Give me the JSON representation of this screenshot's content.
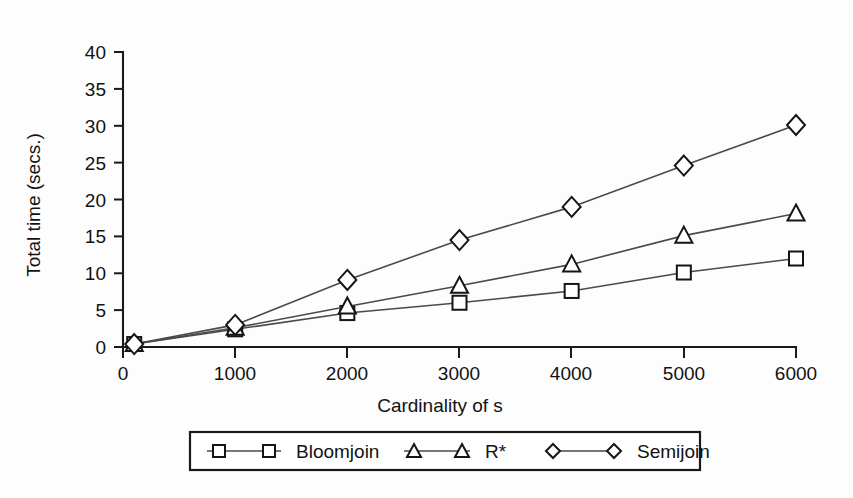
{
  "chart_data": {
    "type": "line",
    "title": "",
    "xlabel": "Cardinality of s",
    "ylabel": "Total time (secs.)",
    "xlim": [
      0,
      6000
    ],
    "ylim": [
      0,
      40
    ],
    "grid": false,
    "legend_position": "bottom",
    "x": [
      100,
      1000,
      2000,
      3000,
      4000,
      5000,
      6000
    ],
    "xticks": [
      "0",
      "1000",
      "2000",
      "3000",
      "4000",
      "5000",
      "6000"
    ],
    "xtick_values": [
      0,
      1000,
      2000,
      3000,
      4000,
      5000,
      6000
    ],
    "yticks": [
      "0",
      "5",
      "10",
      "15",
      "20",
      "25",
      "30",
      "35",
      "40"
    ],
    "ytick_values": [
      0,
      5,
      10,
      15,
      20,
      25,
      30,
      35,
      40
    ],
    "series": [
      {
        "name": "Bloomjoin",
        "marker": "square",
        "values": [
          0.4,
          2.4,
          4.6,
          6.0,
          7.6,
          10.1,
          12.0
        ]
      },
      {
        "name": "R*",
        "marker": "triangle",
        "values": [
          0.4,
          2.6,
          5.5,
          8.3,
          11.2,
          15.1,
          18.1
        ]
      },
      {
        "name": "Semijoin",
        "marker": "diamond",
        "values": [
          0.4,
          3.0,
          9.1,
          14.5,
          19.0,
          24.6,
          30.1
        ]
      }
    ]
  },
  "axes": {
    "y_title": "Total time (secs.)",
    "x_title": "Cardinality of s"
  },
  "legend": {
    "entries": [
      {
        "label": "Bloomjoin",
        "marker": "square"
      },
      {
        "label": "R*",
        "marker": "triangle"
      },
      {
        "label": "Semijoin",
        "marker": "diamond"
      }
    ]
  },
  "colors": {
    "ink": "#151515",
    "line": "#4a4a4a",
    "background": "#fdfdfd",
    "marker_fill": "#ffffff"
  }
}
